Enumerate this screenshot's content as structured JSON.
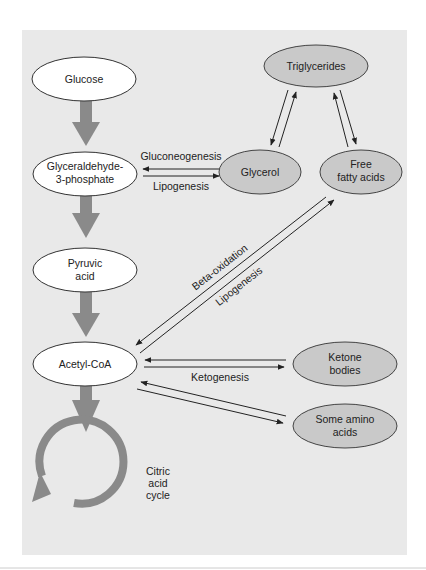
{
  "colors": {
    "panel": "#e9e9e9",
    "white_node": "#ffffff",
    "gray_node": "#c9c9c9",
    "thick_arrow": "#8a8a8a",
    "stroke": "#333333"
  },
  "nodes": {
    "glucose": "Glucose",
    "g3p_line1": "Glyceraldehyde-",
    "g3p_line2": "3-phosphate",
    "pyruvic_line1": "Pyruvic",
    "pyruvic_line2": "acid",
    "acetyl": "Acetyl-CoA",
    "triglycerides": "Triglycerides",
    "glycerol": "Glycerol",
    "ffa_line1": "Free",
    "ffa_line2": "fatty acids",
    "ketone_line1": "Ketone",
    "ketone_line2": "bodies",
    "amino_line1": "Some amino",
    "amino_line2": "acids",
    "citric_line1": "Citric",
    "citric_line2": "acid",
    "citric_line3": "cycle"
  },
  "edges": {
    "gluconeogenesis": "Gluconeogenesis",
    "lipogenesis_glycerol": "Lipogenesis",
    "beta_oxidation": "Beta-oxidation",
    "lipogenesis_ffa": "Lipogenesis",
    "ketogenesis": "Ketogenesis"
  }
}
